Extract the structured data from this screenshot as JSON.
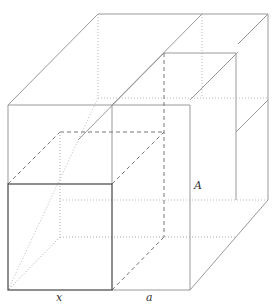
{
  "diagram": {
    "type": "3d-box-decomposition",
    "labels": {
      "x": "x",
      "a": "a",
      "A": "A"
    },
    "colors": {
      "solid_front": "#555555",
      "solid_light": "#aaaaaa",
      "hidden": "#bbbbbb",
      "dashed": "#777777"
    }
  }
}
